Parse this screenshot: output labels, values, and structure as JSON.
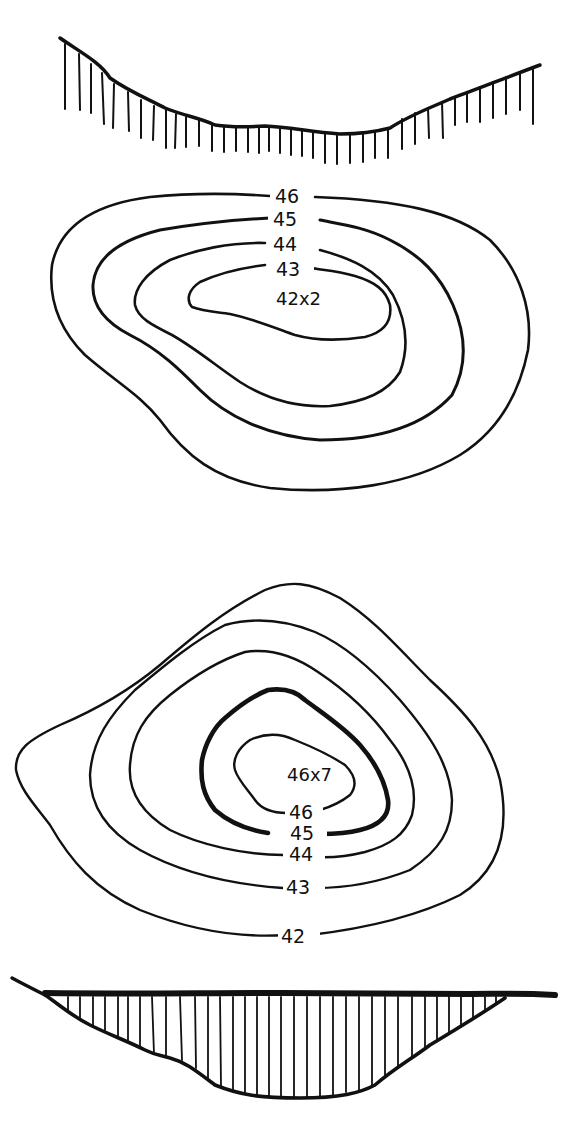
{
  "figures": [
    {
      "name": "depression",
      "profile": "concave-ground-line-with-hatching-below",
      "contours": [
        {
          "label": "46",
          "order": "outermost"
        },
        {
          "label": "45"
        },
        {
          "label": "44"
        },
        {
          "label": "43",
          "order": "innermost"
        }
      ],
      "spot_height": "42x2"
    },
    {
      "name": "hill",
      "profile": "flat-surface-with-hatched-mound-below",
      "contours": [
        {
          "label": "42",
          "order": "outermost"
        },
        {
          "label": "43"
        },
        {
          "label": "44"
        },
        {
          "label": "45",
          "index_contour": true
        },
        {
          "label": "46",
          "order": "innermost"
        }
      ],
      "spot_height": "46x7"
    }
  ],
  "top": {
    "labels": {
      "c46": "46",
      "c45": "45",
      "c44": "44",
      "c43": "43"
    },
    "spot": "42x2"
  },
  "bottom": {
    "labels": {
      "c42": "42",
      "c43": "43",
      "c44": "44",
      "c45": "45",
      "c46": "46"
    },
    "spot": "46x7"
  },
  "colors": {
    "ink": "#111111",
    "paper": "#ffffff"
  }
}
